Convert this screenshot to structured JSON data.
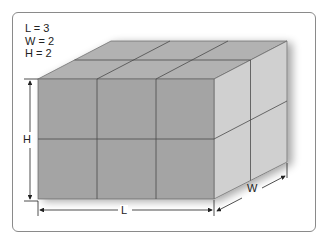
{
  "legend": {
    "lines": [
      "L = 3",
      "W = 2",
      "H = 2"
    ]
  },
  "dimensions": {
    "length": {
      "label": "L",
      "value": 3
    },
    "width": {
      "label": "W",
      "value": 2
    },
    "height": {
      "label": "H",
      "value": 2
    }
  },
  "colors": {
    "front_face": "#a3a3a3",
    "top_face": "#b4b4b4",
    "side_face": "#cfcfcf",
    "grid_line": "#555555",
    "frame": "#8a8a8a"
  }
}
